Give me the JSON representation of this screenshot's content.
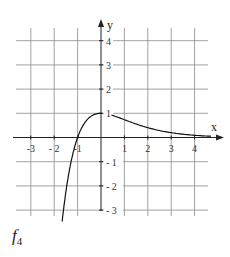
{
  "figure": {
    "label_main": "f",
    "label_sub": "4"
  },
  "chart_data": {
    "type": "line",
    "title": "",
    "xlabel": "x",
    "ylabel": "y",
    "xlim": [
      -3.5,
      5
    ],
    "ylim": [
      -3.2,
      5
    ],
    "x_ticks": [
      -3,
      -2,
      -1,
      1,
      2,
      3,
      4
    ],
    "x_tick_labels": [
      "-3",
      "- 2",
      "-1",
      "1",
      "2",
      "3",
      "4"
    ],
    "y_ticks": [
      4,
      3,
      2,
      1,
      -1,
      -2,
      -3
    ],
    "y_tick_labels": [
      "4",
      "3",
      "2",
      "1",
      "- 1",
      "- 2",
      "- 3"
    ],
    "grid": true,
    "legend": "none",
    "series": [
      {
        "name": "f4",
        "formula": "(x+1)e^(-x)",
        "x": [
          -1.66,
          -1.6,
          -1.5,
          -1.4,
          -1.2,
          -1.0,
          -0.8,
          -0.6,
          -0.4,
          -0.2,
          0,
          0.5,
          1,
          1.5,
          2,
          2.5,
          3,
          3.5,
          4,
          4.7
        ],
        "y": [
          -3.47,
          -2.97,
          -2.24,
          -1.62,
          -0.66,
          0,
          0.45,
          0.73,
          0.89,
          0.98,
          1,
          0.91,
          0.74,
          0.56,
          0.41,
          0.29,
          0.2,
          0.14,
          0.09,
          0.05
        ]
      }
    ]
  }
}
